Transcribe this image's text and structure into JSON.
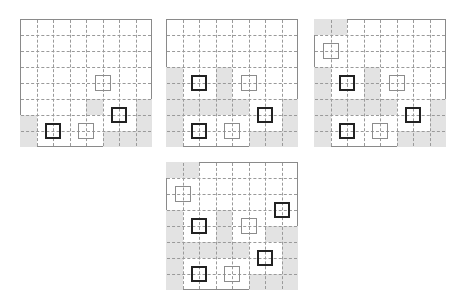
{
  "figure": {
    "colors": {
      "shade": "#e3e3e3",
      "black_marker": "#222222",
      "gray_marker": "#8c8c8c",
      "grid_line": "#9a9a9a",
      "border": "#8a8a8a"
    },
    "grids": [
      {
        "id": "grid-1",
        "left": 20,
        "top": 19,
        "cols": 8,
        "rows": 8,
        "shaded": [
          [
            5,
            4
          ],
          [
            5,
            7
          ],
          [
            6,
            7
          ],
          [
            7,
            7
          ],
          [
            6,
            0
          ],
          [
            7,
            0
          ],
          [
            7,
            5
          ],
          [
            7,
            6
          ]
        ],
        "markers": [
          {
            "type": "gray",
            "col": 5,
            "row": 4
          },
          {
            "type": "black",
            "col": 6,
            "row": 6
          },
          {
            "type": "black",
            "col": 2,
            "row": 7
          },
          {
            "type": "gray",
            "col": 4,
            "row": 7
          }
        ]
      },
      {
        "id": "grid-2",
        "left": 166,
        "top": 19,
        "cols": 8,
        "rows": 8,
        "shaded": [
          [
            3,
            0
          ],
          [
            3,
            3
          ],
          [
            4,
            0
          ],
          [
            4,
            3
          ],
          [
            5,
            0
          ],
          [
            5,
            1
          ],
          [
            5,
            2
          ],
          [
            5,
            3
          ],
          [
            5,
            4
          ],
          [
            5,
            7
          ],
          [
            6,
            0
          ],
          [
            6,
            7
          ],
          [
            7,
            0
          ],
          [
            7,
            5
          ],
          [
            7,
            6
          ],
          [
            7,
            7
          ]
        ],
        "markers": [
          {
            "type": "black",
            "col": 2,
            "row": 4
          },
          {
            "type": "gray",
            "col": 5,
            "row": 4
          },
          {
            "type": "black",
            "col": 6,
            "row": 6
          },
          {
            "type": "black",
            "col": 2,
            "row": 7
          },
          {
            "type": "gray",
            "col": 4,
            "row": 7
          }
        ]
      },
      {
        "id": "grid-3",
        "left": 314,
        "top": 19,
        "cols": 8,
        "rows": 8,
        "shaded": [
          [
            0,
            0
          ],
          [
            0,
            1
          ],
          [
            3,
            0
          ],
          [
            3,
            3
          ],
          [
            4,
            0
          ],
          [
            4,
            3
          ],
          [
            5,
            0
          ],
          [
            5,
            1
          ],
          [
            5,
            2
          ],
          [
            5,
            3
          ],
          [
            5,
            4
          ],
          [
            5,
            7
          ],
          [
            6,
            0
          ],
          [
            6,
            7
          ],
          [
            7,
            0
          ],
          [
            7,
            5
          ],
          [
            7,
            6
          ],
          [
            7,
            7
          ]
        ],
        "markers": [
          {
            "type": "gray",
            "col": 1,
            "row": 2
          },
          {
            "type": "black",
            "col": 2,
            "row": 4
          },
          {
            "type": "gray",
            "col": 5,
            "row": 4
          },
          {
            "type": "black",
            "col": 6,
            "row": 6
          },
          {
            "type": "black",
            "col": 2,
            "row": 7
          },
          {
            "type": "gray",
            "col": 4,
            "row": 7
          }
        ]
      },
      {
        "id": "grid-4",
        "left": 166,
        "top": 162,
        "cols": 8,
        "rows": 8,
        "shaded": [
          [
            0,
            0
          ],
          [
            0,
            1
          ],
          [
            3,
            0
          ],
          [
            3,
            3
          ],
          [
            4,
            0
          ],
          [
            4,
            3
          ],
          [
            4,
            6
          ],
          [
            4,
            7
          ],
          [
            5,
            0
          ],
          [
            5,
            1
          ],
          [
            5,
            2
          ],
          [
            5,
            3
          ],
          [
            5,
            4
          ],
          [
            5,
            7
          ],
          [
            6,
            0
          ],
          [
            6,
            7
          ],
          [
            7,
            0
          ],
          [
            7,
            5
          ],
          [
            7,
            6
          ],
          [
            7,
            7
          ]
        ],
        "markers": [
          {
            "type": "gray",
            "col": 1,
            "row": 2
          },
          {
            "type": "black",
            "col": 7,
            "row": 3
          },
          {
            "type": "black",
            "col": 2,
            "row": 4
          },
          {
            "type": "gray",
            "col": 5,
            "row": 4
          },
          {
            "type": "black",
            "col": 6,
            "row": 6
          },
          {
            "type": "black",
            "col": 2,
            "row": 7
          },
          {
            "type": "gray",
            "col": 4,
            "row": 7
          }
        ]
      }
    ]
  }
}
